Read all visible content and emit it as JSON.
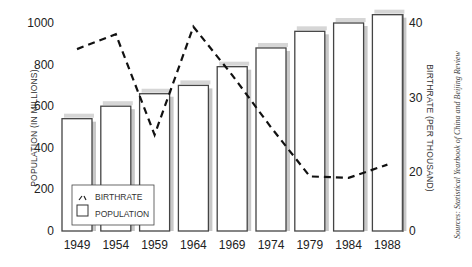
{
  "chart_data": {
    "type": "bar",
    "title": "",
    "categories": [
      "1949",
      "1954",
      "1959",
      "1964",
      "1969",
      "1974",
      "1979",
      "1984",
      "1988"
    ],
    "series": [
      {
        "name": "POPULATION",
        "kind": "bar",
        "axis": "left",
        "values": [
          540,
          600,
          660,
          700,
          790,
          880,
          960,
          1000,
          1040
        ]
      },
      {
        "name": "BIRTHRATE",
        "kind": "line",
        "style": "dashed",
        "axis": "right",
        "values": [
          36.5,
          38.5,
          25,
          39.5,
          33,
          26,
          18.5,
          18,
          21
        ]
      }
    ],
    "xlabel": "",
    "ylabel": "POPULATION (IN MILLIONS)",
    "y2label": "BIRTHRATE (PER THOUSAND)",
    "ylim": [
      0,
      1000
    ],
    "y2lim": [
      0,
      40
    ],
    "yticks": [
      "0",
      "200",
      "400",
      "600",
      "800",
      "1000"
    ],
    "y2ticks": [
      "0",
      "20",
      "30",
      "40"
    ],
    "grid": false,
    "legend": {
      "position": "lower-left",
      "entries": [
        "BIRTHRATE",
        "POPULATION"
      ]
    },
    "source": "Sources: Statistical Yearbook of China and Beijing Review"
  }
}
